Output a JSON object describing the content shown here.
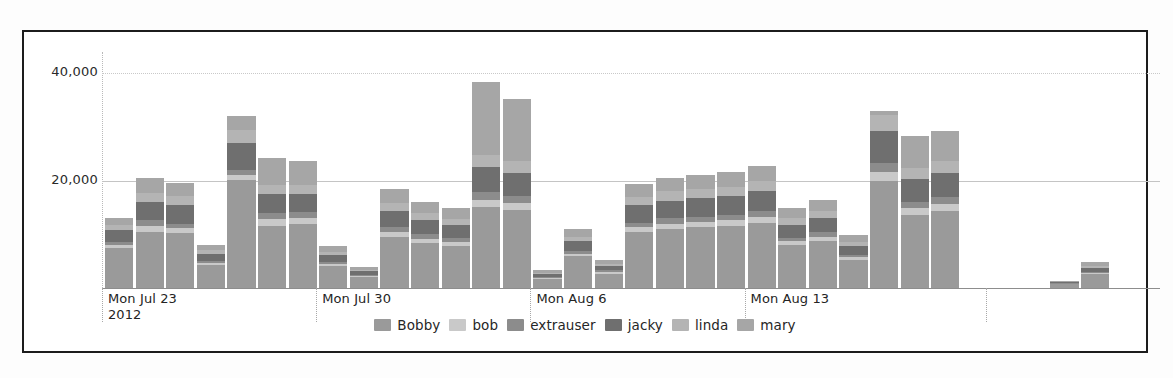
{
  "chart_data": {
    "type": "bar",
    "stacked": true,
    "title": "",
    "xlabel": "",
    "ylabel": "",
    "ylim": [
      0,
      44000
    ],
    "yticks": [
      20000,
      40000
    ],
    "ytick_labels": [
      "20,000",
      "40,000"
    ],
    "grid": true,
    "legend_position": "bottom",
    "category_labels": [
      "Mon Jul 23\n2012",
      "Mon Jul 30",
      "Mon Aug 6",
      "Mon Aug 13"
    ],
    "series": [
      {
        "name": "Bobby",
        "color": "#9a9a9a",
        "values": [
          7400,
          10500,
          10200,
          4200,
          20200,
          11600,
          11900,
          4100,
          2100,
          9600,
          8400,
          7900,
          15100,
          14500,
          1700,
          5900,
          2700,
          10400,
          11000,
          11300,
          11600,
          12200,
          8000,
          8800,
          5200,
          19900,
          13700,
          14400,
          0,
          700,
          2600
        ]
      },
      {
        "name": "bob",
        "color": "#c9c9c9",
        "values": [
          600,
          1100,
          900,
          400,
          900,
          1200,
          1100,
          400,
          200,
          900,
          800,
          700,
          1400,
          1300,
          200,
          500,
          300,
          900,
          1000,
          1000,
          1000,
          1100,
          700,
          800,
          500,
          1700,
          1200,
          1300,
          0,
          100,
          200
        ]
      },
      {
        "name": "extrauser",
        "color": "#8c8c8c",
        "values": [
          600,
          1100,
          900,
          400,
          900,
          1200,
          1100,
          400,
          200,
          900,
          800,
          700,
          1400,
          1300,
          200,
          500,
          300,
          900,
          1000,
          1000,
          1000,
          1100,
          700,
          800,
          500,
          1700,
          1200,
          1300,
          0,
          100,
          200
        ]
      },
      {
        "name": "jacky",
        "color": "#6f6f6f",
        "values": [
          2200,
          3300,
          3400,
          1300,
          5000,
          3500,
          3500,
          1300,
          600,
          3000,
          2600,
          2400,
          4600,
          4400,
          500,
          1800,
          800,
          3200,
          3300,
          3400,
          3500,
          3700,
          2400,
          2700,
          1600,
          6000,
          4200,
          4400,
          0,
          200,
          800
        ]
      },
      {
        "name": "linda",
        "color": "#b4b4b4",
        "values": [
          900,
          1700,
          1700,
          700,
          2500,
          1800,
          1700,
          600,
          300,
          1500,
          1300,
          1200,
          2300,
          2200,
          300,
          900,
          400,
          1600,
          1700,
          1700,
          1700,
          1800,
          1200,
          1300,
          800,
          3000,
          2100,
          2200,
          0,
          100,
          400
        ]
      },
      {
        "name": "mary",
        "color": "#a6a6a6",
        "values": [
          1300,
          2800,
          2400,
          1000,
          2500,
          4900,
          4400,
          1100,
          500,
          2600,
          2200,
          2000,
          13700,
          11500,
          400,
          1500,
          700,
          2400,
          2600,
          2700,
          2800,
          2900,
          1900,
          2100,
          1200,
          700,
          5900,
          5600,
          0,
          200,
          600
        ]
      }
    ],
    "bar_count": 31,
    "gap_after_index": 27
  },
  "yaxis": {
    "labels": [
      {
        "text": "40,000",
        "value": 40000
      },
      {
        "text": "20,000",
        "value": 20000
      }
    ]
  },
  "xaxis": {
    "groups": [
      {
        "label": "Mon Jul 23\n2012"
      },
      {
        "label": "Mon Jul 30"
      },
      {
        "label": "Mon Aug 6"
      },
      {
        "label": "Mon Aug 13"
      }
    ]
  },
  "legend": {
    "items": [
      {
        "label": "Bobby",
        "color": "#9a9a9a"
      },
      {
        "label": "bob",
        "color": "#c9c9c9"
      },
      {
        "label": "extrauser",
        "color": "#8c8c8c"
      },
      {
        "label": "jacky",
        "color": "#6f6f6f"
      },
      {
        "label": "linda",
        "color": "#b4b4b4"
      },
      {
        "label": "mary",
        "color": "#a6a6a6"
      }
    ]
  }
}
